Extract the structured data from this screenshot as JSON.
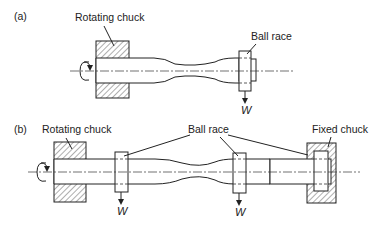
{
  "figure": {
    "panel_a": {
      "label": "(a)",
      "rotating_chuck_label": "Rotating chuck",
      "ball_race_label": "Ball race",
      "load_label": "W"
    },
    "panel_b": {
      "label": "(b)",
      "rotating_chuck_label": "Rotating chuck",
      "ball_race_label": "Ball race",
      "fixed_chuck_label": "Fixed chuck",
      "load_label_1": "W",
      "load_label_2": "W"
    }
  },
  "colors": {
    "line": "#222222",
    "background": "#ffffff"
  }
}
